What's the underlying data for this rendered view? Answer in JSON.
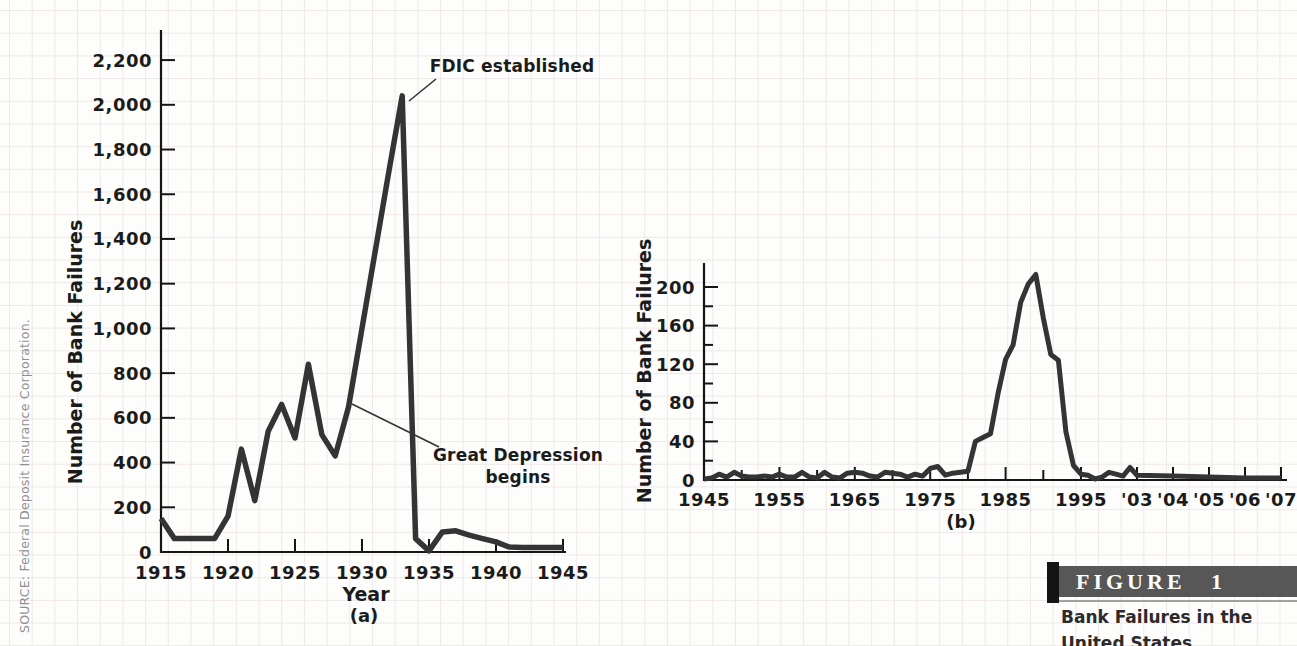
{
  "page": {
    "source_note": "SOURCE: Federal Deposit Insurance Corporation.",
    "figure": {
      "label": "FIGURE 1",
      "caption_line1": "Bank Failures in the",
      "caption_line2": "United States"
    }
  },
  "colors": {
    "line": "#343434",
    "axis": "#151515",
    "text": "#1b1b1b",
    "grid": "#efe8e8",
    "figure_bar_bg": "#575757",
    "figure_bar_text": "#ffffff",
    "figure_accent": "#141414",
    "source_text": "#8f8f8f",
    "caption_text": "#2b2b2b"
  },
  "chart_data": [
    {
      "type": "line",
      "panel_label": "(a)",
      "xlabel": "Year",
      "ylabel": "Number of Bank Failures",
      "ylim": [
        0,
        2330
      ],
      "grid": false,
      "x_tick_values": [
        1915,
        1920,
        1925,
        1930,
        1935,
        1940,
        1945
      ],
      "x_tick_labels": [
        "1915",
        "1920",
        "1925",
        "1930",
        "1935",
        "1940",
        "1945"
      ],
      "y_tick_values": [
        0,
        200,
        400,
        600,
        800,
        1000,
        1200,
        1400,
        1600,
        1800,
        2000,
        2200
      ],
      "y_tick_labels": [
        "0",
        "200",
        "400",
        "600",
        "800",
        "1,000",
        "1,200",
        "1,400",
        "1,600",
        "1,800",
        "2,000",
        "2,200"
      ],
      "annotations": [
        {
          "id": "fdic",
          "text": "FDIC established"
        },
        {
          "id": "depression",
          "text": "Great Depression\nbegins"
        }
      ],
      "series": [
        {
          "name": "Bank failures 1915-1945",
          "x": [
            1915,
            1916,
            1917,
            1918,
            1919,
            1920,
            1921,
            1922,
            1923,
            1924,
            1925,
            1926,
            1927,
            1928,
            1929,
            1930,
            1931,
            1932,
            1933,
            1934,
            1935,
            1936,
            1937,
            1938,
            1939,
            1940,
            1941,
            1942,
            1943,
            1944,
            1945
          ],
          "y": [
            150,
            60,
            60,
            60,
            60,
            160,
            460,
            230,
            540,
            660,
            510,
            840,
            525,
            430,
            650,
            1000,
            1350,
            1700,
            2040,
            60,
            5,
            90,
            95,
            75,
            60,
            45,
            22,
            20,
            20,
            20,
            20
          ]
        }
      ]
    },
    {
      "type": "line",
      "panel_label": "(b)",
      "xlabel": "",
      "ylabel": "Number of Bank Failures",
      "ylim": [
        0,
        222
      ],
      "grid": false,
      "x_tick_values": [
        1945,
        1955,
        1965,
        1975,
        1985,
        1995,
        2003,
        2004,
        2005,
        2006,
        2007
      ],
      "x_tick_labels": [
        "1945",
        "1955",
        "1965",
        "1975",
        "1985",
        "1995",
        "'03",
        "'04",
        "'05",
        "'06",
        "'07"
      ],
      "x_minor_ticks": [
        1950,
        1960,
        1970,
        1980,
        1990
      ],
      "y_tick_values": [
        0,
        40,
        80,
        120,
        160,
        200
      ],
      "y_tick_labels": [
        "0",
        "40",
        "80",
        "120",
        "160",
        "200"
      ],
      "y_minor_ticks": [
        20,
        60,
        100,
        140,
        180
      ],
      "annotations": [],
      "series": [
        {
          "name": "Bank failures 1945-2007",
          "x": [
            1945,
            1946,
            1947,
            1948,
            1949,
            1950,
            1951,
            1952,
            1953,
            1954,
            1955,
            1956,
            1957,
            1958,
            1959,
            1960,
            1961,
            1962,
            1963,
            1964,
            1965,
            1966,
            1967,
            1968,
            1969,
            1970,
            1971,
            1972,
            1973,
            1974,
            1975,
            1976,
            1977,
            1978,
            1979,
            1980,
            1981,
            1982,
            1983,
            1984,
            1985,
            1986,
            1987,
            1988,
            1989,
            1990,
            1991,
            1992,
            1993,
            1994,
            1995,
            1996,
            1997,
            1998,
            1999,
            2000,
            2001,
            2002,
            2003,
            2004,
            2005,
            2006,
            2007
          ],
          "y": [
            1,
            2,
            6,
            3,
            8,
            4,
            3,
            3,
            4,
            3,
            6,
            3,
            3,
            8,
            3,
            2,
            8,
            3,
            2,
            7,
            8,
            7,
            4,
            3,
            8,
            7,
            6,
            3,
            6,
            4,
            12,
            14,
            5,
            7,
            8,
            9,
            40,
            44,
            48,
            90,
            125,
            140,
            184,
            203,
            213,
            168,
            130,
            124,
            50,
            15,
            6,
            5,
            1,
            3,
            8,
            6,
            4,
            13,
            5,
            4,
            3,
            2,
            2
          ]
        }
      ]
    }
  ]
}
